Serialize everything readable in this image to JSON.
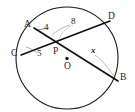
{
  "figure": {
    "colors": {
      "stroke": "#1a1a1a",
      "chord": "#111111",
      "leader": "#8a8a8a",
      "background": "#ffffff"
    },
    "circle": {
      "cx": 67,
      "cy": 58,
      "r": 51
    },
    "center_marker": {
      "cx": 67,
      "cy": 58.5,
      "label": "O"
    },
    "intersection": {
      "x": 60,
      "y": 44,
      "label": "P"
    },
    "points": [
      {
        "name": "A",
        "label": "A",
        "px": 34,
        "py": 28,
        "lx": 24,
        "ly": 20
      },
      {
        "name": "D",
        "label": "D",
        "px": 110,
        "py": 21,
        "lx": 108,
        "ly": 12
      },
      {
        "name": "C",
        "label": "C",
        "px": 21,
        "py": 55,
        "lx": 11,
        "ly": 49
      },
      {
        "name": "B",
        "label": "B",
        "px": 118,
        "py": 81,
        "lx": 120,
        "ly": 73
      }
    ],
    "segment_labels": [
      {
        "name": "AP",
        "text": "4",
        "lx": 44,
        "ly": 23
      },
      {
        "name": "PD",
        "text": "8",
        "lx": 71,
        "ly": 17
      },
      {
        "name": "CP",
        "text": "5",
        "lx": 37,
        "ly": 49
      },
      {
        "name": "PB",
        "text": "x",
        "lx": 91,
        "ly": 47
      }
    ],
    "chords": [
      {
        "name": "chord-AB",
        "from": "A",
        "to": "B"
      },
      {
        "name": "chord-CD",
        "from": "C",
        "to": "D"
      }
    ],
    "leaders": [
      {
        "name": "leader-4",
        "from_label": "4",
        "to_point": "AP"
      },
      {
        "name": "leader-8",
        "from_label": "8",
        "to_point": "PD"
      },
      {
        "name": "leader-5",
        "from_label": "5",
        "to_point": "CP"
      },
      {
        "name": "leader-x",
        "from_label": "x",
        "to_point": "PB"
      }
    ]
  }
}
